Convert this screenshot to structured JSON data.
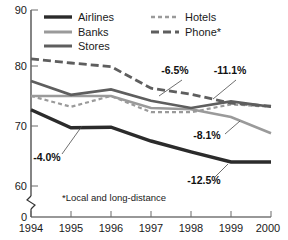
{
  "chart_data": {
    "type": "line",
    "title": "",
    "xlabel": "",
    "ylabel": "",
    "x": [
      1994,
      1995,
      1996,
      1997,
      1998,
      1999,
      2000
    ],
    "xlim": [
      1994,
      2000
    ],
    "ylim": [
      60,
      90
    ],
    "y_axis_break": true,
    "y_axis_break_to": 0,
    "grid": false,
    "legend_position": "top-inside",
    "xtick_labels": [
      "1994",
      "1995",
      "1996",
      "1997",
      "1998",
      "1999",
      "2000"
    ],
    "ytick_labels": [
      "90",
      "80",
      "70",
      "60",
      "0"
    ],
    "ytick_values": [
      90,
      80,
      70,
      60,
      0
    ],
    "series": [
      {
        "name": "Airlines",
        "style": "solid-thick-dark",
        "color": "#2b2b2b",
        "values": [
          72.7,
          69.7,
          69.8,
          67.5,
          65.7,
          64.0,
          64.0
        ]
      },
      {
        "name": "Banks",
        "style": "solid-light",
        "color": "#9a9a9a",
        "values": [
          75.0,
          75.0,
          75.0,
          73.0,
          72.8,
          71.5,
          68.8
        ]
      },
      {
        "name": "Stores",
        "style": "solid-medium",
        "color": "#5e5e5e",
        "values": [
          77.5,
          75.2,
          76.1,
          74.2,
          73.0,
          74.1,
          73.2
        ]
      },
      {
        "name": "Hotels",
        "style": "dotted-light",
        "color": "#9a9a9a",
        "values": [
          75.0,
          73.2,
          75.0,
          72.3,
          72.3,
          73.6,
          73.2
        ]
      },
      {
        "name": "Phone*",
        "style": "dashed-dark",
        "color": "#5e5e5e",
        "values": [
          81.2,
          80.5,
          79.9,
          76.3,
          75.3,
          73.8,
          73.3
        ]
      }
    ],
    "annotations": [
      {
        "text": "-6.5%",
        "series": "Stores",
        "x": 175,
        "y": 74
      },
      {
        "text": "-11.1%",
        "series": "Phone*",
        "x": 228,
        "y": 74
      },
      {
        "text": "-8.1%",
        "series": "Banks",
        "x": 207,
        "y": 139
      },
      {
        "text": "-12.5%",
        "series": "Airlines",
        "x": 204,
        "y": 184
      },
      {
        "text": "-4.0%",
        "series": "Hotels",
        "x": 47,
        "y": 161
      }
    ],
    "footnote": "*Local and long-distance",
    "legend": [
      {
        "label": "Airlines",
        "style": "solid-thick-dark"
      },
      {
        "label": "Banks",
        "style": "solid-light"
      },
      {
        "label": "Stores",
        "style": "solid-medium"
      },
      {
        "label": "Hotels",
        "style": "dotted-light"
      },
      {
        "label": "Phone*",
        "style": "dashed-dark"
      }
    ]
  }
}
